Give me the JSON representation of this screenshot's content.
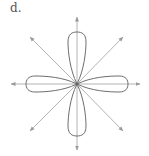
{
  "figure": {
    "label": "d.",
    "center": [
      77,
      84
    ],
    "colors": {
      "axis": "#b4b4b4",
      "curve": "#6e6e6e",
      "label": "#555555",
      "background": "#ffffff"
    },
    "axes": [
      {
        "name": "up",
        "angle_deg": 90
      },
      {
        "name": "down",
        "angle_deg": 270
      },
      {
        "name": "left",
        "angle_deg": 180
      },
      {
        "name": "right",
        "angle_deg": 0
      },
      {
        "name": "up-left",
        "angle_deg": 135
      },
      {
        "name": "up-right",
        "angle_deg": 45
      },
      {
        "name": "down-left",
        "angle_deg": 225
      },
      {
        "name": "down-right",
        "angle_deg": 315
      }
    ],
    "petals": [
      {
        "name": "top",
        "direction_deg": 90
      },
      {
        "name": "bottom",
        "direction_deg": 270
      },
      {
        "name": "left",
        "direction_deg": 180
      },
      {
        "name": "right",
        "direction_deg": 0
      }
    ]
  }
}
